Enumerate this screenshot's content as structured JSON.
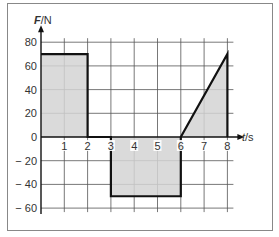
{
  "chart_data": {
    "type": "area",
    "title": "",
    "xlabel": "t/s",
    "ylabel": "F/N",
    "x_ticks": [
      "1",
      "2",
      "3",
      "4",
      "5",
      "6",
      "7",
      "8"
    ],
    "y_ticks": [
      "80",
      "60",
      "40",
      "20",
      "0",
      "-20",
      "-40",
      "-60"
    ],
    "xlim": [
      0,
      8
    ],
    "ylim": [
      -60,
      80
    ],
    "grid": true,
    "legend": null,
    "series": [
      {
        "name": "F(t)",
        "points": [
          [
            0,
            70
          ],
          [
            2,
            70
          ],
          [
            2,
            0
          ],
          [
            3,
            0
          ],
          [
            3,
            -50
          ],
          [
            6,
            -50
          ],
          [
            6,
            0
          ],
          [
            8,
            70
          ],
          [
            8,
            0
          ]
        ]
      }
    ],
    "shaded_regions": [
      {
        "name": "positive-impulse-1",
        "shape": "rectangle",
        "t_start": 0,
        "t_end": 2,
        "F": 70
      },
      {
        "name": "negative-impulse",
        "shape": "rectangle",
        "t_start": 3,
        "t_end": 6,
        "F": -50
      },
      {
        "name": "positive-impulse-2",
        "shape": "triangle",
        "vertices": [
          [
            6,
            0
          ],
          [
            8,
            70
          ],
          [
            8,
            0
          ]
        ]
      }
    ],
    "colors": {
      "fill": "#d3d3d3",
      "line": "#111111",
      "grid": "#555555",
      "frame": "#888888"
    }
  },
  "labels": {
    "y_axis_title_italic": "F",
    "y_axis_title_unit": "/N",
    "x_axis_title_italic": "t",
    "x_axis_title_unit": "/s",
    "origin": "0"
  }
}
